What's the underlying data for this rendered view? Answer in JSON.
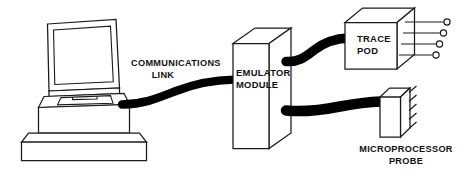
{
  "diagram": {
    "background_color": "#ffffff",
    "line_color": "#1a1a1a",
    "cable_color": "#000000",
    "labels": {
      "communications_link_line1": "COMMUNICATIONS",
      "communications_link_line2": "LINK",
      "emulator_line1": "EMULATOR",
      "emulator_line2": "MODULE",
      "trace_pod_line1": "TRACE",
      "trace_pod_line2": "POD",
      "probe_line1": "MICROPROCESSOR",
      "probe_line2": "PROBE"
    },
    "components": [
      {
        "name": "host-computer",
        "label": "",
        "description": "Desktop workstation with CRT monitor, keyboard tray and base pedestal"
      },
      {
        "name": "emulator-module",
        "label": "EMULATOR MODULE",
        "description": "Tall 3D rectangular box, isometric"
      },
      {
        "name": "trace-pod",
        "label": "TRACE POD",
        "description": "Cube with four probe leads terminating in open circles"
      },
      {
        "name": "microprocessor-probe",
        "label": "MICROPROCESSOR PROBE",
        "description": "Small 3D box with five angled pins on right face"
      }
    ],
    "connections": [
      {
        "name": "communications-link-cable",
        "from": "host-computer",
        "to": "emulator-module",
        "label": "COMMUNICATIONS LINK"
      },
      {
        "name": "trace-pod-cable",
        "from": "emulator-module",
        "to": "trace-pod",
        "label": ""
      },
      {
        "name": "probe-cable",
        "from": "emulator-module",
        "to": "microprocessor-probe",
        "label": ""
      }
    ],
    "trace_pod_lead_count": 4,
    "probe_pin_count": 5
  }
}
